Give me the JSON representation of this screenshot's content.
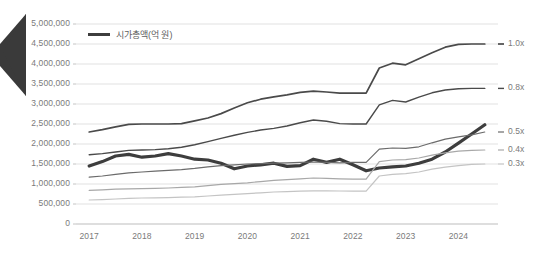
{
  "chart_data": {
    "type": "line",
    "title": "",
    "subtitle": "",
    "xlabel": "",
    "ylabel": "",
    "grid": true,
    "legend_position": "top-left",
    "legend": [
      "시가총액(억 원)"
    ],
    "xlim": [
      2016.75,
      2024.75
    ],
    "ylim": [
      0,
      5000000
    ],
    "ytick_labels": [
      "5,000,000",
      "4,500,000",
      "4,000,000",
      "3,500,000",
      "3,000,000",
      "2,500,000",
      "2,000,000",
      "1,500,000",
      "1,000,000",
      "500,000",
      "0"
    ],
    "ytick_values": [
      5000000,
      4500000,
      4000000,
      3500000,
      3000000,
      2500000,
      2000000,
      1500000,
      1000000,
      500000,
      0
    ],
    "xtick_labels": [
      "2017",
      "2018",
      "2019",
      "2020",
      "2021",
      "2022",
      "2023",
      "2024"
    ],
    "xtick_values": [
      2017,
      2018,
      2019,
      2020,
      2021,
      2022,
      2023,
      2024
    ],
    "right_axis_labels": [
      "1.0x",
      "0.8x",
      "0.5x",
      "0.4x",
      "0.3x"
    ],
    "right_axis_values": [
      4500000,
      3400000,
      2300000,
      1850000,
      1500000
    ],
    "colors": {
      "highlight_series": "#3d3d3d",
      "series_1": "#4a4a4a",
      "series_2": "#6b6b6b",
      "series_3": "#8a8a8a",
      "series_4": "#a8a8a8",
      "series_5": "#c4c4c4",
      "gridline": "#d9d9d9",
      "axis_text": "#7a7a7a",
      "background": "#ffffff"
    },
    "x": [
      2017.0,
      2017.25,
      2017.5,
      2017.75,
      2018.0,
      2018.25,
      2018.5,
      2018.75,
      2019.0,
      2019.25,
      2019.5,
      2019.75,
      2020.0,
      2020.25,
      2020.5,
      2020.75,
      2021.0,
      2021.25,
      2021.5,
      2021.75,
      2022.0,
      2022.25,
      2022.5,
      2022.75,
      2023.0,
      2023.25,
      2023.5,
      2023.75,
      2024.0,
      2024.25,
      2024.5
    ],
    "series": [
      {
        "name": "1.0x",
        "label": "1.0x",
        "color": "#4a4a4a",
        "width": 1.7,
        "values": [
          2300000,
          2360000,
          2430000,
          2490000,
          2500000,
          2500000,
          2500000,
          2510000,
          2580000,
          2650000,
          2760000,
          2900000,
          3030000,
          3120000,
          3180000,
          3230000,
          3290000,
          3320000,
          3300000,
          3270000,
          3270000,
          3270000,
          3900000,
          4020000,
          3980000,
          4130000,
          4280000,
          4420000,
          4490000,
          4500000,
          4500000
        ]
      },
      {
        "name": "0.8x",
        "label": "0.8x",
        "color": "#4a4a4a",
        "width": 1.4,
        "values": [
          1730000,
          1760000,
          1800000,
          1840000,
          1850000,
          1860000,
          1880000,
          1920000,
          1980000,
          2060000,
          2140000,
          2220000,
          2290000,
          2350000,
          2390000,
          2450000,
          2530000,
          2600000,
          2570000,
          2510000,
          2500000,
          2500000,
          2980000,
          3090000,
          3050000,
          3170000,
          3280000,
          3350000,
          3380000,
          3390000,
          3390000
        ]
      },
      {
        "name": "시가총액(억 원)",
        "label": "시가총액(억 원)",
        "color": "#3d3d3d",
        "width": 3.2,
        "highlight": true,
        "values": [
          1450000,
          1560000,
          1700000,
          1740000,
          1670000,
          1700000,
          1760000,
          1700000,
          1620000,
          1600000,
          1520000,
          1380000,
          1450000,
          1480000,
          1520000,
          1440000,
          1460000,
          1620000,
          1540000,
          1620000,
          1480000,
          1330000,
          1400000,
          1430000,
          1450000,
          1520000,
          1620000,
          1800000,
          2020000,
          2250000,
          2480000
        ]
      },
      {
        "name": "0.5x",
        "label": "0.5x",
        "color": "#6b6b6b",
        "width": 1.2,
        "values": [
          1170000,
          1200000,
          1240000,
          1280000,
          1300000,
          1320000,
          1340000,
          1360000,
          1390000,
          1430000,
          1460000,
          1480000,
          1500000,
          1510000,
          1520000,
          1530000,
          1540000,
          1550000,
          1540000,
          1530000,
          1540000,
          1540000,
          1870000,
          1900000,
          1890000,
          1930000,
          2030000,
          2120000,
          2180000,
          2230000,
          2300000
        ]
      },
      {
        "name": "0.4x",
        "label": "0.4x",
        "color": "#a8a8a8",
        "width": 1.2,
        "values": [
          840000,
          855000,
          870000,
          880000,
          885000,
          890000,
          900000,
          915000,
          930000,
          960000,
          990000,
          1010000,
          1030000,
          1060000,
          1090000,
          1110000,
          1130000,
          1150000,
          1140000,
          1130000,
          1120000,
          1120000,
          1560000,
          1600000,
          1610000,
          1650000,
          1720000,
          1780000,
          1820000,
          1840000,
          1850000
        ]
      },
      {
        "name": "0.3x",
        "label": "0.3x",
        "color": "#c4c4c4",
        "width": 1.2,
        "values": [
          600000,
          610000,
          625000,
          640000,
          650000,
          655000,
          660000,
          670000,
          680000,
          700000,
          720000,
          740000,
          760000,
          780000,
          800000,
          810000,
          820000,
          830000,
          830000,
          825000,
          820000,
          820000,
          1200000,
          1240000,
          1260000,
          1300000,
          1370000,
          1420000,
          1460000,
          1490000,
          1500000
        ]
      }
    ]
  },
  "legend": {
    "label": "시가총액(억 원)"
  },
  "decor": {
    "arrow_name": "chevron-left-pointer"
  }
}
